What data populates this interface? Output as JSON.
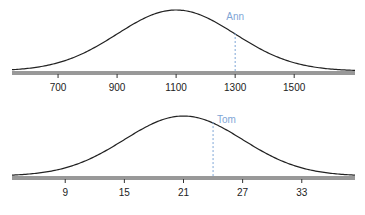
{
  "chart_data": [
    {
      "type": "line",
      "title": "",
      "xlabel": "",
      "ylabel": "",
      "distribution": "normal",
      "mean": 1100,
      "sd": 200,
      "xlim": [
        544,
        1706
      ],
      "ticks": [
        700,
        900,
        1100,
        1300,
        1500
      ],
      "tick_labels": [
        "700",
        "900",
        "1100",
        "1300",
        "1500"
      ],
      "grid": false,
      "marker": {
        "label": "Ann",
        "x": 1300,
        "style": "dashed"
      },
      "colors": {
        "curve": "#222222",
        "axis": "#333333",
        "marker": "#7fa6d6"
      }
    },
    {
      "type": "line",
      "title": "",
      "xlabel": "",
      "ylabel": "",
      "distribution": "normal",
      "mean": 21,
      "sd": 6,
      "xlim": [
        3.6,
        38.4
      ],
      "ticks": [
        9,
        15,
        21,
        27,
        33
      ],
      "tick_labels": [
        "9",
        "15",
        "21",
        "27",
        "33"
      ],
      "grid": false,
      "marker": {
        "label": "Tom",
        "x": 24,
        "style": "dashed"
      },
      "colors": {
        "curve": "#222222",
        "axis": "#333333",
        "marker": "#7fa6d6"
      }
    }
  ]
}
